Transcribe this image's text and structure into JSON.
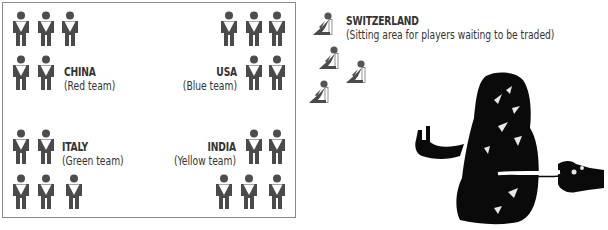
{
  "diagram": {
    "field_area": {
      "teams": [
        {
          "country": "CHINA",
          "team": "(Red team)",
          "player_count": 5
        },
        {
          "country": "USA",
          "team": "(Blue team)",
          "player_count": 5
        },
        {
          "country": "ITALY",
          "team": "(Green team)",
          "player_count": 5
        },
        {
          "country": "INDIA",
          "team": "(Yellow team)",
          "player_count": 5
        }
      ]
    },
    "sitting_area": {
      "country": "SWITZERLAND",
      "description": "(Sitting area for players waiting to be traded)",
      "player_count": 4
    },
    "illustration": "person-holding-rope-illustration",
    "colors": {
      "figure": "#4a4a4a",
      "border": "#8a8a8a",
      "text": "#333333"
    }
  }
}
